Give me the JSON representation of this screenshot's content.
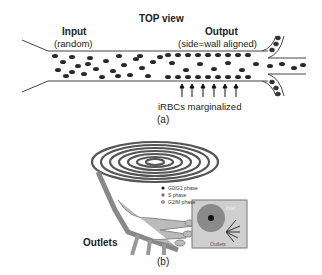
{
  "panel_a": {
    "title": "TOP view",
    "input_label": "Input",
    "input_sub": "(random)",
    "output_label": "Output",
    "output_sub": "(side=wall aligned)",
    "annotation": "iRBCs marginalized",
    "caption": "(a)"
  },
  "panel_b": {
    "legend": [
      {
        "label": "G0/G1 phase",
        "color": "#111111"
      },
      {
        "label": "S phase",
        "color": "#777777"
      },
      {
        "label": "G2/M phase",
        "color": "#999999"
      }
    ],
    "outlets_label": "Outlets",
    "inset_inlet": "Inlet",
    "inset_outlets": "Outlets",
    "caption": "(b)"
  }
}
